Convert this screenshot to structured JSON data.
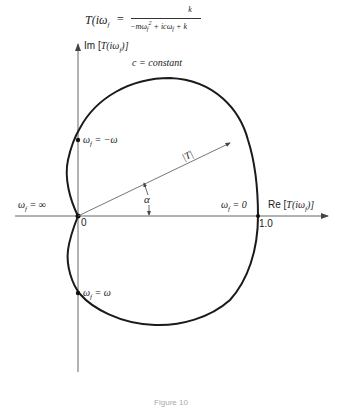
{
  "formula": {
    "lhs": "T(iω",
    "lhs_sub": "f",
    "lhs_close": ") =",
    "numerator": "k",
    "denominator": "−mω_f² + icω_f + k",
    "den_parts": [
      "−mω",
      "f",
      "2",
      " + icω",
      "f",
      " + k"
    ]
  },
  "axes": {
    "imag_label_prefix": "Im [",
    "imag_label_func": "T(iω",
    "imag_label_sub": "f",
    "imag_label_suffix": ")]",
    "real_label_prefix": "Re [",
    "real_label_func": "T(iω",
    "real_label_sub": "f",
    "real_label_suffix": ")]",
    "origin_label": "0",
    "unit_label": "1.0"
  },
  "curve": {
    "label": "c = constant"
  },
  "points": {
    "neg_omega": {
      "prefix": "ω",
      "sub": "f",
      "rest": " = −ω"
    },
    "pos_omega": {
      "prefix": "ω",
      "sub": "f",
      "rest": " = ω"
    },
    "infinity": {
      "prefix": "ω",
      "sub": "f",
      "rest": " = ∞"
    },
    "zero": {
      "prefix": "ω",
      "sub": "f",
      "rest": " = 0"
    }
  },
  "vector": {
    "magnitude_label": "|T|",
    "angle_label": "α"
  },
  "colors": {
    "curve": "#1a1a1a",
    "axes": "#555555",
    "background": "#ffffff"
  },
  "caption": "Figure 10"
}
